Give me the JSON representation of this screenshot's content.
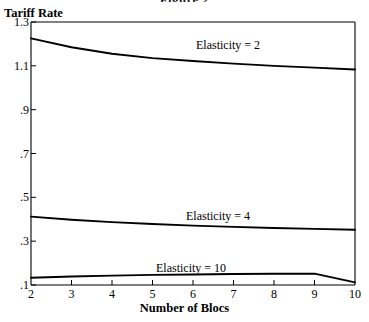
{
  "figure": {
    "title": "Figure 2",
    "ylabel": "Tariff Rate",
    "xlabel": "Number of Blocs"
  },
  "axis": {
    "y_ticks": [
      "1.3",
      "1.1",
      ".9",
      ".7",
      ".5",
      ".3",
      ".1"
    ],
    "x_ticks": [
      "2",
      "3",
      "4",
      "5",
      "6",
      "7",
      "8",
      "9",
      "10"
    ]
  },
  "annotations": {
    "elasticity_2": "Elasticity = 2",
    "elasticity_4": "Elasticity = 4",
    "elasticity_10": "Elasticity = 10"
  },
  "chart_data": {
    "type": "line",
    "title": "Figure 2",
    "xlabel": "Number of Blocs",
    "ylabel": "Tariff Rate",
    "xlim": [
      2,
      10
    ],
    "ylim": [
      0.1,
      1.3
    ],
    "yticks": [
      1.3,
      1.1,
      0.9,
      0.7,
      0.5,
      0.3,
      0.1
    ],
    "xticks": [
      2,
      3,
      4,
      5,
      6,
      7,
      8,
      9,
      10
    ],
    "grid": false,
    "legend": "inline-annotations",
    "line_color": "#000000",
    "x": [
      2,
      3,
      4,
      5,
      6,
      7,
      8,
      9,
      10
    ],
    "series": [
      {
        "name": "Elasticity = 2",
        "values": [
          1.225,
          1.185,
          1.155,
          1.135,
          1.122,
          1.11,
          1.1,
          1.092,
          1.083
        ]
      },
      {
        "name": "Elasticity = 4",
        "values": [
          0.412,
          0.398,
          0.387,
          0.378,
          0.371,
          0.365,
          0.36,
          0.356,
          0.352
        ]
      },
      {
        "name": "Elasticity = 10",
        "values": [
          0.133,
          0.139,
          0.143,
          0.146,
          0.148,
          0.15,
          0.151,
          0.152,
          0.112
        ]
      }
    ]
  },
  "layout": {
    "plot_left": 31,
    "plot_right": 355,
    "plot_top": 22,
    "plot_bottom": 285,
    "label_positions": {
      "elasticity_2": {
        "x": 196,
        "y": 39
      },
      "elasticity_4": {
        "x": 186,
        "y": 210
      },
      "elasticity_10": {
        "x": 156,
        "y": 262
      }
    }
  }
}
